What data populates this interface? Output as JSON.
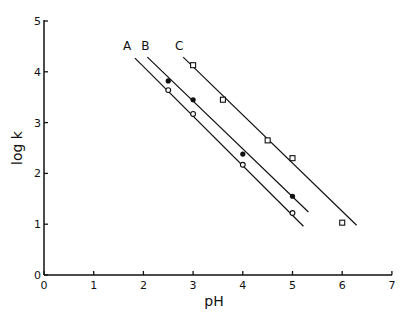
{
  "chart_data": {
    "type": "line",
    "title": "",
    "xlabel": "pH",
    "ylabel": "log k",
    "xlim": [
      0,
      7
    ],
    "ylim": [
      0,
      5
    ],
    "xticks": [
      "0",
      "1",
      "2",
      "3",
      "4",
      "5",
      "6",
      "7"
    ],
    "yticks": [
      "0",
      "1",
      "2",
      "3",
      "4",
      "5"
    ],
    "grid": false,
    "legend": "inline line labels A, B, C",
    "series": [
      {
        "name": "A",
        "marker": "open-circle",
        "points": [
          [
            2.5,
            3.64
          ],
          [
            3.0,
            3.17
          ],
          [
            4.0,
            2.17
          ],
          [
            5.0,
            1.22
          ]
        ],
        "fit_line": [
          [
            1.83,
            4.27
          ],
          [
            5.22,
            0.96
          ]
        ]
      },
      {
        "name": "B",
        "marker": "filled-circle",
        "points": [
          [
            2.5,
            3.82
          ],
          [
            3.0,
            3.45
          ],
          [
            4.0,
            2.38
          ],
          [
            5.0,
            1.55
          ]
        ],
        "fit_line": [
          [
            2.08,
            4.29
          ],
          [
            5.32,
            1.24
          ]
        ]
      },
      {
        "name": "C",
        "marker": "open-square",
        "points": [
          [
            3.0,
            4.13
          ],
          [
            3.6,
            3.45
          ],
          [
            4.5,
            2.65
          ],
          [
            5.0,
            2.3
          ],
          [
            6.0,
            1.03
          ]
        ],
        "fit_line": [
          [
            2.8,
            4.29
          ],
          [
            6.29,
            0.98
          ]
        ]
      }
    ],
    "line_labels": [
      {
        "text": "A",
        "x": 1.67,
        "y": 4.5
      },
      {
        "text": "B",
        "x": 2.04,
        "y": 4.5
      },
      {
        "text": "C",
        "x": 2.72,
        "y": 4.5
      }
    ]
  }
}
